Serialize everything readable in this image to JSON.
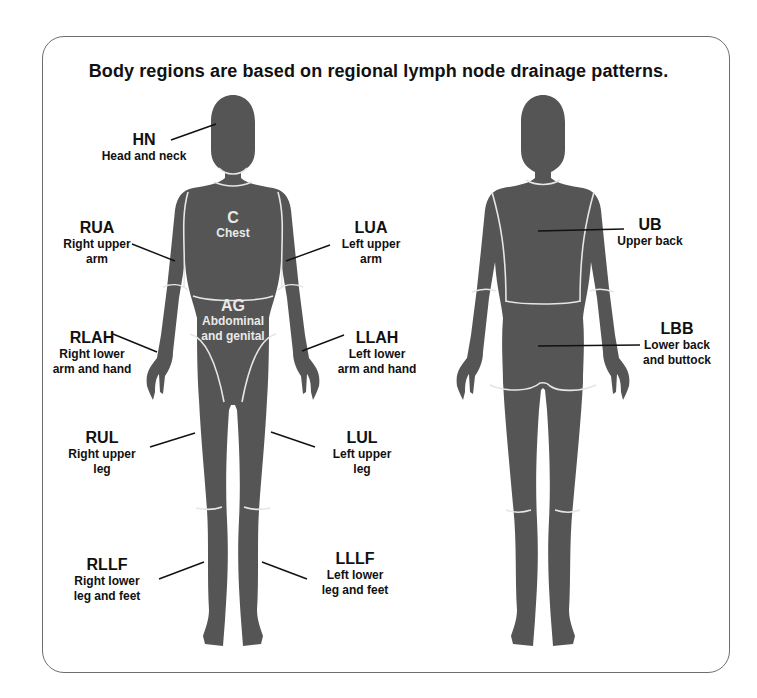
{
  "title": "Body regions are based on regional lymph node drainage patterns.",
  "colors": {
    "silhouette": "#555555",
    "seam": "#e6e6e6",
    "frame": "#6e6e6e",
    "text": "#111111",
    "inner_text": "#e9e9e9"
  },
  "front_view": {
    "regions": [
      {
        "code": "HN",
        "desc": "Head and neck"
      },
      {
        "code": "C",
        "desc": "Chest"
      },
      {
        "code": "RUA",
        "desc_line1": "Right upper",
        "desc_line2": "arm"
      },
      {
        "code": "LUA",
        "desc_line1": "Left upper",
        "desc_line2": "arm"
      },
      {
        "code": "AG",
        "desc_line1": "Abdominal",
        "desc_line2": "and genital"
      },
      {
        "code": "RLAH",
        "desc_line1": "Right lower",
        "desc_line2": "arm and hand"
      },
      {
        "code": "LLAH",
        "desc_line1": "Left lower",
        "desc_line2": "arm and hand"
      },
      {
        "code": "RUL",
        "desc_line1": "Right upper",
        "desc_line2": "leg"
      },
      {
        "code": "LUL",
        "desc_line1": "Left upper",
        "desc_line2": "leg"
      },
      {
        "code": "RLLF",
        "desc_line1": "Right lower",
        "desc_line2": "leg and feet"
      },
      {
        "code": "LLLF",
        "desc_line1": "Left lower",
        "desc_line2": "leg and feet"
      }
    ]
  },
  "back_view": {
    "regions": [
      {
        "code": "UB",
        "desc": "Upper back"
      },
      {
        "code": "LBB",
        "desc_line1": "Lower back",
        "desc_line2": "and buttock"
      }
    ]
  }
}
